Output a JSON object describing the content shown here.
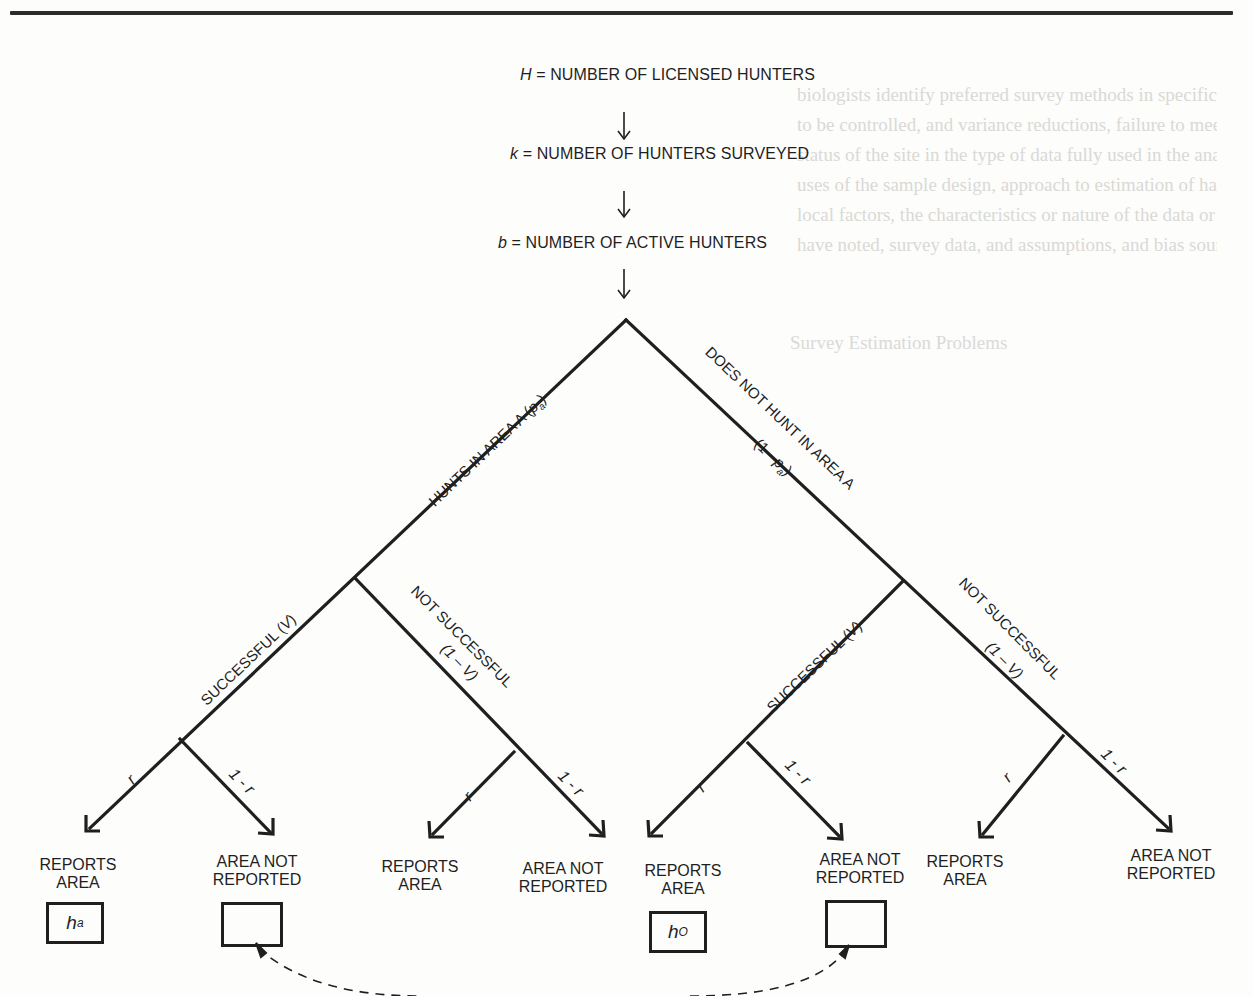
{
  "page": {
    "rule": true,
    "bleed_through_text": [
      "biologists identify preferred survey methods in specifically used",
      "to be controlled, and variance reductions, failure to meet the ecological",
      "status of the site in the type of data fully used in the analysis of the",
      "uses of the sample design, approach to estimation of harvest",
      "local factors, the characteristics or nature of the data or sample design",
      "have noted, survey data, and assumptions, and bias sources."
    ],
    "bleed_through_heading": "Survey Estimation Problems"
  },
  "diagram": {
    "title_chain": [
      {
        "var": "H",
        "text": " = NUMBER OF LICENSED HUNTERS"
      },
      {
        "var": "k",
        "text": " = NUMBER OF HUNTERS SURVEYED"
      },
      {
        "var": "b",
        "text": " = NUMBER OF ACTIVE HUNTERS"
      }
    ],
    "branches": {
      "area_yes": {
        "label": "HUNTS IN AREA A (",
        "var": "p",
        "sub": "a",
        "close": ")"
      },
      "area_no": {
        "label": "DOES NOT HUNT IN AREA A",
        "prob_open": "(1 - ",
        "var": "p",
        "sub": "a",
        "close": ")"
      },
      "success_left": {
        "label": "SUCCESSFUL (",
        "var": "V",
        "close": ")"
      },
      "fail_left": {
        "label": "NOT SUCCESSFUL",
        "prob": "(1 – V)"
      },
      "success_right": {
        "label": "SUCCESSFUL (",
        "var": "V",
        "close": ")"
      },
      "fail_right": {
        "label": "NOT SUCCESSFUL",
        "prob": "(1 – V)"
      }
    },
    "report_probs": {
      "report": "r",
      "not_report": "1 - r"
    },
    "leaves": [
      {
        "label_line1": "REPORTS",
        "label_line2": "AREA",
        "box": {
          "var": "h",
          "sub": "a"
        }
      },
      {
        "label_line1": "AREA NOT",
        "label_line2": "REPORTED",
        "box": {
          "var": "",
          "sub": ""
        }
      },
      {
        "label_line1": "REPORTS",
        "label_line2": "AREA",
        "box": null
      },
      {
        "label_line1": "AREA NOT",
        "label_line2": "REPORTED",
        "box": null
      },
      {
        "label_line1": "REPORTS",
        "label_line2": "AREA",
        "box": {
          "var": "h",
          "sub": "O"
        }
      },
      {
        "label_line1": "AREA NOT",
        "label_line2": "REPORTED",
        "box": {
          "var": "",
          "sub": ""
        }
      },
      {
        "label_line1": "REPORTS",
        "label_line2": "AREA",
        "box": null
      },
      {
        "label_line1": "AREA NOT",
        "label_line2": "REPORTED",
        "box": null
      }
    ],
    "connector": {
      "style": "dashed",
      "links": [
        "leaf-2-box",
        "leaf-6-box"
      ]
    }
  }
}
